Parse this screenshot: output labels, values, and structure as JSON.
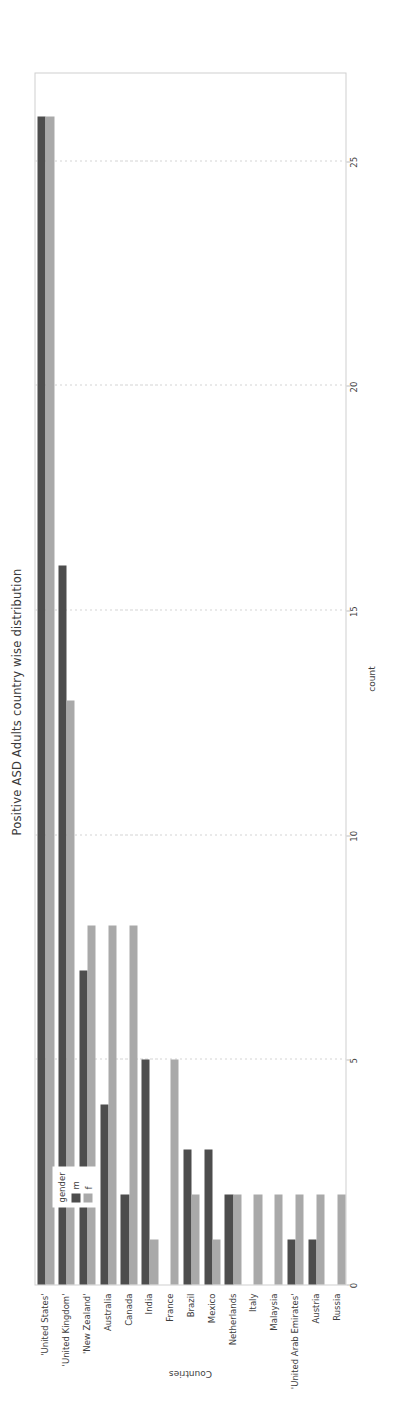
{
  "chart_data": {
    "type": "bar",
    "orientation": "vertical",
    "title": "Positive ASD Adults country wise distribution",
    "xlabel": "Countries",
    "ylabel": "count",
    "ylim": [
      0,
      27
    ],
    "yticks": [
      0,
      5,
      10,
      15,
      20,
      25
    ],
    "ytick_labels": [
      "0",
      "5",
      "10",
      "15",
      "20",
      "25"
    ],
    "grid": true,
    "grid_axis": "y",
    "legend": {
      "title": "gender",
      "position": "upper-right",
      "entries": [
        {
          "label": "m",
          "color": "#4d4d4d"
        },
        {
          "label": "f",
          "color": "#a9a9a9"
        }
      ]
    },
    "categories": [
      "'United States'",
      "'United Kingdom'",
      "'New Zealand'",
      "Australia",
      "Canada",
      "India",
      "France",
      "Brazil",
      "Mexico",
      "Netherlands",
      "Italy",
      "Malaysia",
      "'United Arab Emirates'",
      "Austria",
      "Russia"
    ],
    "series": [
      {
        "name": "m",
        "color": "#4d4d4d",
        "values": [
          26,
          16,
          7,
          4,
          2,
          5,
          0,
          3,
          3,
          2,
          0,
          0,
          1,
          1,
          0
        ]
      },
      {
        "name": "f",
        "color": "#a9a9a9",
        "values": [
          26,
          13,
          8,
          8,
          8,
          1,
          5,
          2,
          1,
          2,
          2,
          2,
          2,
          2,
          2
        ]
      }
    ]
  },
  "colors": {
    "male": "#4d4d4d",
    "female": "#a9a9a9",
    "grid": "#d4d4d4",
    "axis": "#cfcfcf",
    "text": "#3d3d3d",
    "background": "#ffffff"
  }
}
